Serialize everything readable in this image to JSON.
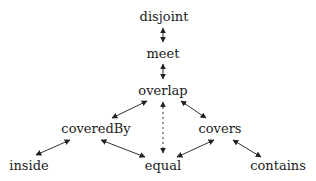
{
  "diagram": {
    "title": "",
    "nodes": [
      {
        "id": "disjoint",
        "label": "disjoint",
        "x": 164,
        "y": 16
      },
      {
        "id": "meet",
        "label": "meet",
        "x": 163,
        "y": 53
      },
      {
        "id": "overlap",
        "label": "overlap",
        "x": 163,
        "y": 90
      },
      {
        "id": "coveredBy",
        "label": "coveredBy",
        "x": 96,
        "y": 128
      },
      {
        "id": "covers",
        "label": "covers",
        "x": 220,
        "y": 128
      },
      {
        "id": "inside",
        "label": "inside",
        "x": 29,
        "y": 165
      },
      {
        "id": "equal",
        "label": "equal",
        "x": 163,
        "y": 165
      },
      {
        "id": "contains",
        "label": "contains",
        "x": 278,
        "y": 165
      }
    ],
    "edges": [
      {
        "from": "disjoint",
        "to": "meet",
        "style": "solid",
        "direction": "both",
        "x1": 163,
        "y1": 28,
        "x2": 163,
        "y2": 42
      },
      {
        "from": "meet",
        "to": "overlap",
        "style": "solid",
        "direction": "both",
        "x1": 163,
        "y1": 64,
        "x2": 163,
        "y2": 79
      },
      {
        "from": "overlap",
        "to": "coveredBy",
        "style": "solid",
        "direction": "both",
        "x1": 147,
        "y1": 101,
        "x2": 112,
        "y2": 118
      },
      {
        "from": "overlap",
        "to": "covers",
        "style": "solid",
        "direction": "both",
        "x1": 181,
        "y1": 101,
        "x2": 206,
        "y2": 118
      },
      {
        "from": "overlap",
        "to": "equal",
        "style": "dashed",
        "direction": "both",
        "x1": 163,
        "y1": 102,
        "x2": 163,
        "y2": 153
      },
      {
        "from": "coveredBy",
        "to": "inside",
        "style": "solid",
        "direction": "both",
        "x1": 70,
        "y1": 140,
        "x2": 36,
        "y2": 155
      },
      {
        "from": "coveredBy",
        "to": "equal",
        "style": "solid",
        "direction": "both",
        "x1": 101,
        "y1": 140,
        "x2": 145,
        "y2": 157
      },
      {
        "from": "covers",
        "to": "equal",
        "style": "solid",
        "direction": "both",
        "x1": 214,
        "y1": 140,
        "x2": 177,
        "y2": 157
      },
      {
        "from": "covers",
        "to": "contains",
        "style": "solid",
        "direction": "both",
        "x1": 233,
        "y1": 140,
        "x2": 261,
        "y2": 157
      }
    ],
    "colors": {
      "line": "#333333",
      "text": "#1a1a1a",
      "background": "#ffffff"
    }
  }
}
